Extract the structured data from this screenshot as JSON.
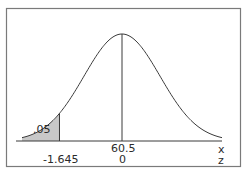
{
  "chart_data": {
    "type": "area",
    "title": "",
    "distribution": "normal",
    "mean_x": 60.5,
    "mean_z": 0,
    "critical_z": -1.645,
    "tail": "left",
    "shaded_area": 0.05,
    "xlabel": "x",
    "zlabel": "z",
    "annotations": [
      {
        "text": ".05",
        "position": "left tail, above shaded region"
      },
      {
        "text": "60.5",
        "position": "below mean line, x-scale"
      },
      {
        "text": "0",
        "position": "below mean line, z-scale"
      },
      {
        "text": "-1.645",
        "position": "below critical value, z-scale"
      }
    ],
    "grid": false,
    "legend": null
  },
  "labels": {
    "tail_area": ".05",
    "mean_x": "60.5",
    "mean_z": "0",
    "critical_z": "-1.645",
    "x_axis": "x",
    "z_axis": "z"
  },
  "colors": {
    "curve": "#3a3a3a",
    "shade": "#c8c8c8",
    "frame": "#7a7a7a",
    "axis": "#3a3a3a"
  }
}
